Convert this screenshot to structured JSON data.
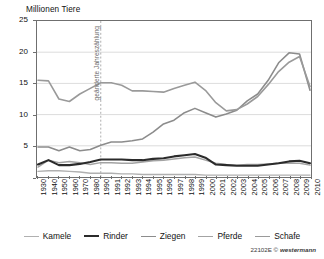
{
  "chart_data": {
    "type": "line",
    "title": "",
    "ylabel": "Millionen Tiere",
    "xlabel": "",
    "ylim": [
      0,
      25
    ],
    "yticks": [
      0,
      5,
      10,
      15,
      20,
      25
    ],
    "ytick_labels": [
      "",
      "5",
      "10",
      "15",
      "20",
      "25"
    ],
    "grid": "horizontal",
    "legend_position": "bottom",
    "categories": [
      "1930",
      "1940",
      "1950",
      "1960",
      "1970",
      "1980",
      "1990",
      "1991",
      "1992",
      "1993",
      "1994",
      "1995",
      "1996",
      "1997",
      "1998",
      "1999",
      "2000",
      "2001",
      "2002",
      "2003",
      "2004",
      "2005",
      "2006",
      "2007",
      "2008",
      "2009",
      "2010"
    ],
    "annotations": [
      {
        "text": "geänderte Jahreszählung",
        "at_category": "1990",
        "orientation": "vertical",
        "line_style": "dashed",
        "color": "#9a9a9a"
      }
    ],
    "series": [
      {
        "name": "Kamele",
        "color": "#b0b0b0",
        "width": 1.3,
        "values": [
          0.9,
          1.0,
          1.0,
          0.9,
          0.8,
          0.6,
          0.6,
          0.6,
          0.5,
          0.5,
          0.4,
          0.4,
          0.4,
          0.4,
          0.4,
          0.4,
          0.3,
          0.3,
          0.3,
          0.3,
          0.3,
          0.3,
          0.3,
          0.3,
          0.3,
          0.3,
          0.3
        ]
      },
      {
        "name": "Rinder",
        "color": "#2b2b2b",
        "width": 2.1,
        "values": [
          2.0,
          2.7,
          1.9,
          1.9,
          2.1,
          2.4,
          2.8,
          2.8,
          2.8,
          2.7,
          2.7,
          2.9,
          3.0,
          3.3,
          3.5,
          3.7,
          3.1,
          2.0,
          1.9,
          1.8,
          1.8,
          1.8,
          2.0,
          2.2,
          2.5,
          2.6,
          2.2
        ]
      },
      {
        "name": "Ziegen",
        "color": "#8c8c8c",
        "width": 1.6,
        "values": [
          4.8,
          4.8,
          4.2,
          4.8,
          4.2,
          4.4,
          5.1,
          5.6,
          5.6,
          5.8,
          6.1,
          7.2,
          8.5,
          9.1,
          10.3,
          11.0,
          10.3,
          9.6,
          10.1,
          10.7,
          12.2,
          13.3,
          15.5,
          18.3,
          19.9,
          19.7,
          13.9
        ]
      },
      {
        "name": "Pferde",
        "color": "#a3a3a3",
        "width": 1.5,
        "values": [
          1.6,
          2.7,
          2.3,
          2.5,
          2.3,
          2.0,
          2.3,
          2.3,
          2.2,
          2.2,
          2.4,
          2.6,
          2.7,
          2.9,
          3.1,
          3.2,
          2.7,
          2.2,
          2.0,
          1.9,
          2.0,
          2.0,
          2.1,
          2.2,
          2.2,
          2.2,
          1.9
        ]
      },
      {
        "name": "Schafe",
        "color": "#9a9a9a",
        "width": 1.6,
        "values": [
          15.5,
          15.4,
          12.5,
          12.1,
          13.3,
          14.2,
          15.1,
          15.1,
          14.7,
          13.8,
          13.8,
          13.7,
          13.6,
          14.2,
          14.7,
          15.2,
          13.9,
          11.9,
          10.6,
          10.8,
          11.7,
          12.9,
          14.8,
          16.9,
          18.4,
          19.3,
          14.5
        ]
      }
    ]
  },
  "footer": {
    "code": "22102E",
    "copyright": "©",
    "publisher": "westermann"
  }
}
